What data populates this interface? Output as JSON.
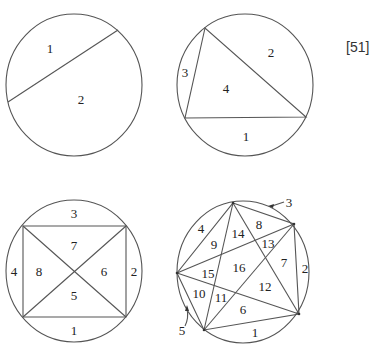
{
  "reference": "[51]",
  "figures": [
    {
      "id": "two-points",
      "points": 2,
      "regions": 2,
      "labels": [
        {
          "text": "1",
          "x": 50,
          "y": 48
        },
        {
          "text": "2",
          "x": 81,
          "y": 99
        }
      ]
    },
    {
      "id": "three-points",
      "points": 3,
      "regions": 4,
      "labels": [
        {
          "text": "2",
          "x": 271,
          "y": 52
        },
        {
          "text": "3",
          "x": 185,
          "y": 72
        },
        {
          "text": "4",
          "x": 226,
          "y": 88
        },
        {
          "text": "1",
          "x": 246,
          "y": 136
        }
      ]
    },
    {
      "id": "four-points",
      "points": 4,
      "regions": 8,
      "labels": [
        {
          "text": "3",
          "x": 74,
          "y": 213
        },
        {
          "text": "7",
          "x": 74,
          "y": 245
        },
        {
          "text": "4",
          "x": 14,
          "y": 271
        },
        {
          "text": "8",
          "x": 39,
          "y": 271
        },
        {
          "text": "6",
          "x": 104,
          "y": 271
        },
        {
          "text": "2",
          "x": 134,
          "y": 271
        },
        {
          "text": "5",
          "x": 74,
          "y": 295
        },
        {
          "text": "1",
          "x": 74,
          "y": 330
        }
      ]
    },
    {
      "id": "five-points",
      "points": 5,
      "regions": 16,
      "labels": [
        {
          "text": "3",
          "x": 289,
          "y": 202
        },
        {
          "text": "4",
          "x": 201,
          "y": 228
        },
        {
          "text": "8",
          "x": 259,
          "y": 224
        },
        {
          "text": "14",
          "x": 238,
          "y": 233
        },
        {
          "text": "9",
          "x": 214,
          "y": 244
        },
        {
          "text": "13",
          "x": 268,
          "y": 243
        },
        {
          "text": "7",
          "x": 284,
          "y": 262
        },
        {
          "text": "16",
          "x": 239,
          "y": 267
        },
        {
          "text": "2",
          "x": 305,
          "y": 268
        },
        {
          "text": "15",
          "x": 208,
          "y": 273
        },
        {
          "text": "12",
          "x": 265,
          "y": 286
        },
        {
          "text": "10",
          "x": 199,
          "y": 293
        },
        {
          "text": "11",
          "x": 221,
          "y": 297
        },
        {
          "text": "6",
          "x": 243,
          "y": 309
        },
        {
          "text": "5",
          "x": 182,
          "y": 330
        },
        {
          "text": "1",
          "x": 255,
          "y": 332
        }
      ]
    }
  ]
}
